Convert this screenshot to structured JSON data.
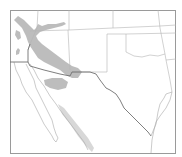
{
  "map": {
    "type": "range-map",
    "region": "Southwestern United States and northern Mexico",
    "colors": {
      "background": "#ffffff",
      "frame": "#9a9a9a",
      "range_fill": "#bdbdbd",
      "range_fill_light": "#d8d8d8",
      "state_borders": "#b4b4b4",
      "international_border": "#707070"
    },
    "layers": [
      {
        "name": "frame",
        "label": ""
      },
      {
        "name": "state-borders",
        "label": ""
      },
      {
        "name": "international-border",
        "label": ""
      },
      {
        "name": "coastline",
        "label": ""
      },
      {
        "name": "species-range",
        "label": ""
      }
    ],
    "labels": []
  }
}
